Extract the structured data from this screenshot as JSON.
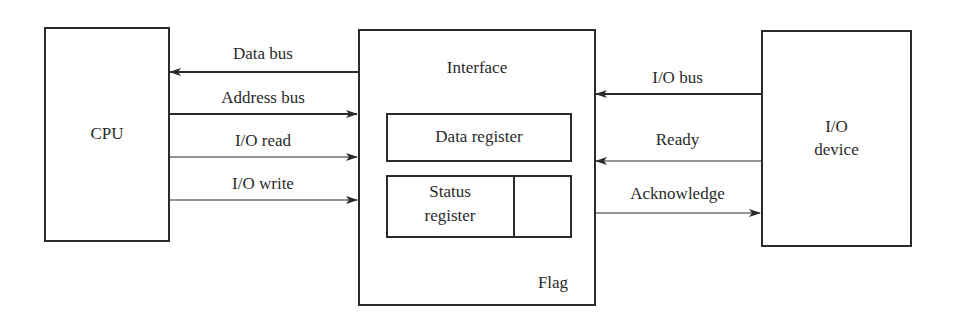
{
  "diagram": {
    "nodes": {
      "cpu": {
        "label": "CPU"
      },
      "interface": {
        "label": "Interface"
      },
      "data_register": {
        "label": "Data register"
      },
      "status_register": {
        "label_line1": "Status",
        "label_line2": "register"
      },
      "flag": {
        "label": "Flag"
      },
      "io_device": {
        "label_line1": "I/O",
        "label_line2": "device"
      }
    },
    "cpu_links": [
      {
        "label": "Data bus",
        "direction": "to-cpu"
      },
      {
        "label": "Address bus",
        "direction": "to-interface"
      },
      {
        "label": "I/O read",
        "direction": "to-interface"
      },
      {
        "label": "I/O write",
        "direction": "to-interface"
      }
    ],
    "device_links": [
      {
        "label": "I/O bus",
        "direction": "to-interface"
      },
      {
        "label": "Ready",
        "direction": "to-interface"
      },
      {
        "label": "Acknowledge",
        "direction": "to-device"
      }
    ],
    "colors": {
      "stroke": "#2a2a2a",
      "background": "#ffffff"
    }
  }
}
